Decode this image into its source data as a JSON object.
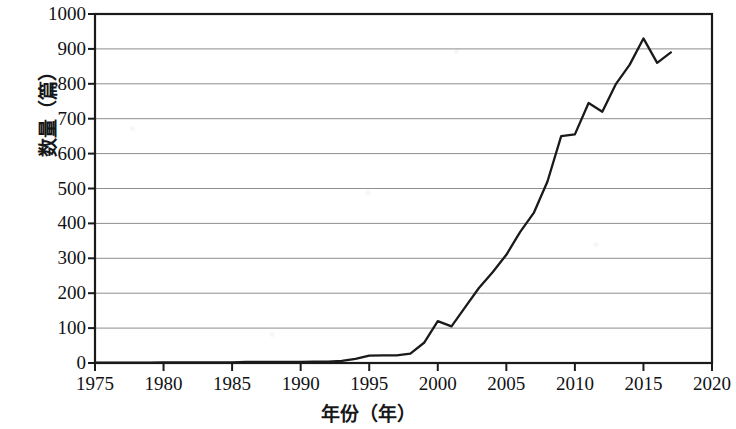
{
  "chart_data": {
    "type": "line",
    "title": "",
    "xlabel": "年份（年）",
    "ylabel": "数量（篇）",
    "xlim": [
      1975,
      2020
    ],
    "ylim": [
      0,
      1000
    ],
    "grid": true,
    "legend": "none",
    "xticks": [
      "1975",
      "1980",
      "1985",
      "1990",
      "1995",
      "2000",
      "2005",
      "2010",
      "2015",
      "2020"
    ],
    "yticks": [
      "0",
      "100",
      "200",
      "300",
      "400",
      "500",
      "600",
      "700",
      "800",
      "900",
      "1000"
    ],
    "series": [
      {
        "name": "数量",
        "color": "#1a1a1a",
        "x": [
          1975,
          1976,
          1977,
          1978,
          1979,
          1980,
          1981,
          1982,
          1983,
          1984,
          1985,
          1986,
          1987,
          1988,
          1989,
          1990,
          1991,
          1992,
          1993,
          1994,
          1995,
          1996,
          1997,
          1998,
          1999,
          2000,
          2001,
          2002,
          2003,
          2004,
          2005,
          2006,
          2007,
          2008,
          2009,
          2010,
          2011,
          2012,
          2013,
          2014,
          2015,
          2016,
          2017
        ],
        "values": [
          1,
          1,
          1,
          1,
          1,
          2,
          2,
          2,
          2,
          2,
          2,
          3,
          3,
          3,
          3,
          3,
          4,
          4,
          6,
          12,
          21,
          22,
          22,
          27,
          58,
          120,
          105,
          160,
          215,
          260,
          310,
          375,
          430,
          520,
          650,
          655,
          745,
          720,
          800,
          855,
          930,
          860,
          890
        ]
      }
    ]
  },
  "axes": {
    "y_title": "数量（篇）",
    "x_title": "年份（年）"
  }
}
